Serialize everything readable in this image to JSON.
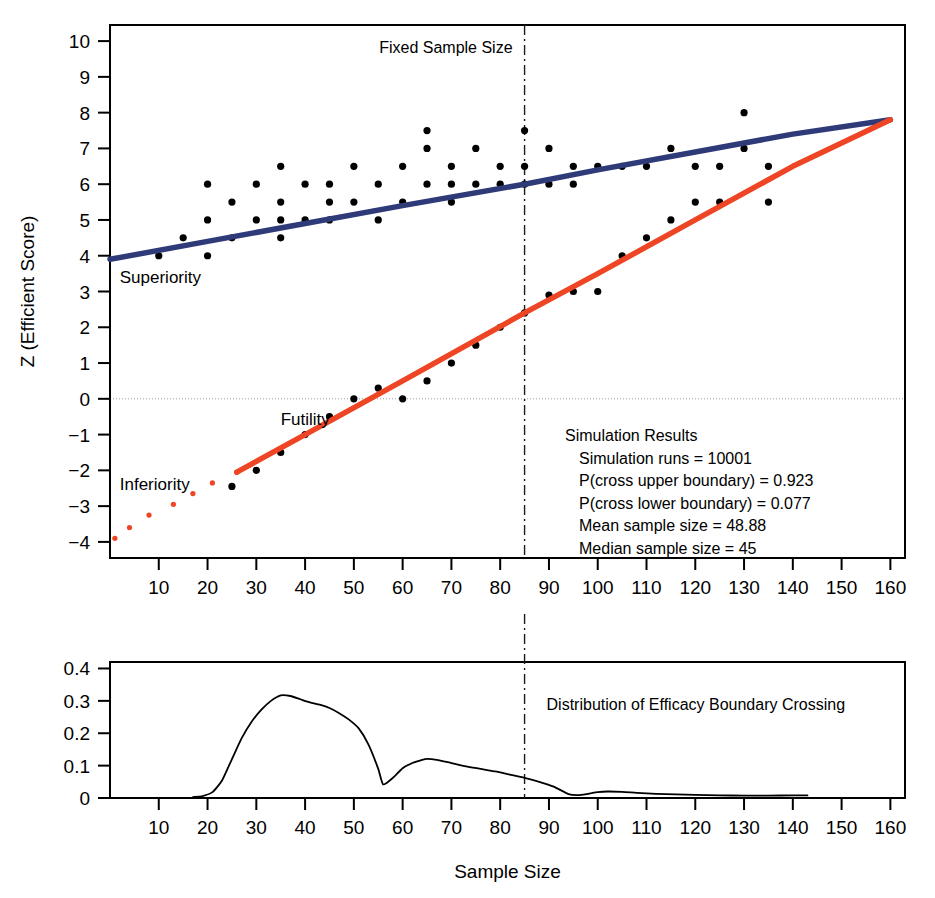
{
  "figure": {
    "name": "group-sequential-boundary-plot",
    "background": "#ffffff"
  },
  "colors": {
    "superiority_line": "#2f3a78",
    "futility_line": "#ee4524",
    "inferiority_points": "#ee4524",
    "scatter_points": "#000000",
    "axis": "#000000",
    "zero_line": "#999999",
    "fixed_sample_line": "#1a1a1a"
  },
  "main_panel": {
    "y_axis_label": "Z (Efficient Score)",
    "x_ticks": [
      10,
      20,
      30,
      40,
      50,
      60,
      70,
      80,
      90,
      100,
      110,
      120,
      130,
      140,
      150,
      160
    ],
    "y_ticks": [
      -4,
      -3,
      -2,
      -1,
      0,
      1,
      2,
      3,
      4,
      5,
      6,
      7,
      8,
      9,
      10
    ],
    "xlim": [
      0,
      163
    ],
    "ylim": [
      -4.45,
      10.45
    ],
    "annotations": {
      "fixed_sample_size": "Fixed Sample Size",
      "superiority": "Superiority",
      "futility": "Futility",
      "inferiority": "Inferiority"
    },
    "fixed_sample_size_x": 85,
    "zero_reference": 0
  },
  "simulation_results": {
    "title": "Simulation Results",
    "lines": [
      "Simulation runs = 10001",
      "P(cross upper boundary) =  0.923",
      "P(cross lower boundary) =  0.077",
      "Mean sample size =  48.88",
      "Median sample size =  45"
    ],
    "runs": 10001,
    "p_cross_upper": 0.923,
    "p_cross_lower": 0.077,
    "mean_sample_size": 48.88,
    "median_sample_size": 45
  },
  "bottom_panel": {
    "x_axis_label": "Sample Size",
    "title": "Distribution of Efficacy Boundary Crossing",
    "x_ticks": [
      10,
      20,
      30,
      40,
      50,
      60,
      70,
      80,
      90,
      100,
      110,
      120,
      130,
      140,
      150,
      160
    ],
    "y_ticks": [
      0,
      0.1,
      0.2,
      0.3,
      0.4
    ],
    "y_tick_labels": [
      "0",
      "0.1",
      "0.2",
      "0.3",
      "0.4"
    ],
    "xlim": [
      0,
      163
    ],
    "ylim": [
      0,
      0.42
    ],
    "fixed_sample_size_x": 85
  },
  "chart_data": {
    "type": "line",
    "xlabel": "Sample Size",
    "ylabel": "Z (Efficient Score)",
    "xlim": [
      0,
      163
    ],
    "ylim": [
      -4.45,
      10.45
    ],
    "grid": false,
    "legend": "inline-annotations",
    "series": [
      {
        "name": "Superiority boundary",
        "type": "line",
        "color": "#2f3a78",
        "points": [
          [
            0,
            3.9
          ],
          [
            20,
            4.4
          ],
          [
            40,
            4.9
          ],
          [
            60,
            5.4
          ],
          [
            85,
            6.0
          ],
          [
            100,
            6.4
          ],
          [
            120,
            6.9
          ],
          [
            140,
            7.4
          ],
          [
            160,
            7.8
          ]
        ]
      },
      {
        "name": "Futility boundary",
        "type": "line",
        "color": "#ee4524",
        "points": [
          [
            26,
            -2.05
          ],
          [
            40,
            -1.0
          ],
          [
            60,
            0.5
          ],
          [
            85,
            2.4
          ],
          [
            100,
            3.5
          ],
          [
            120,
            5.0
          ],
          [
            140,
            6.5
          ],
          [
            160,
            7.8
          ]
        ]
      },
      {
        "name": "Simulated efficient scores (upper cluster)",
        "type": "scatter",
        "color": "#000000",
        "points": [
          [
            10,
            4.0
          ],
          [
            15,
            4.5
          ],
          [
            20,
            4.0
          ],
          [
            20,
            5.0
          ],
          [
            20,
            6.0
          ],
          [
            25,
            4.5
          ],
          [
            25,
            5.5
          ],
          [
            30,
            5.0
          ],
          [
            30,
            6.0
          ],
          [
            35,
            4.5
          ],
          [
            35,
            5.0
          ],
          [
            35,
            5.5
          ],
          [
            35,
            6.5
          ],
          [
            40,
            5.0
          ],
          [
            40,
            6.0
          ],
          [
            45,
            5.0
          ],
          [
            45,
            5.5
          ],
          [
            45,
            6.0
          ],
          [
            50,
            5.5
          ],
          [
            50,
            6.5
          ],
          [
            55,
            5.0
          ],
          [
            55,
            6.0
          ],
          [
            60,
            5.5
          ],
          [
            60,
            6.5
          ],
          [
            65,
            6.0
          ],
          [
            65,
            7.0
          ],
          [
            65,
            7.5
          ],
          [
            70,
            5.5
          ],
          [
            70,
            6.0
          ],
          [
            70,
            6.5
          ],
          [
            75,
            6.0
          ],
          [
            75,
            7.0
          ],
          [
            80,
            6.0
          ],
          [
            80,
            6.5
          ],
          [
            85,
            6.0
          ],
          [
            85,
            6.5
          ],
          [
            85,
            7.5
          ],
          [
            90,
            6.0
          ],
          [
            90,
            7.0
          ],
          [
            95,
            6.0
          ],
          [
            95,
            6.5
          ],
          [
            100,
            6.5
          ],
          [
            105,
            6.5
          ],
          [
            110,
            6.5
          ],
          [
            115,
            7.0
          ],
          [
            120,
            6.5
          ],
          [
            125,
            6.5
          ],
          [
            130,
            7.0
          ],
          [
            130,
            8.0
          ],
          [
            135,
            6.5
          ]
        ]
      },
      {
        "name": "Simulated efficient scores (lower cluster)",
        "type": "scatter",
        "color": "#000000",
        "points": [
          [
            25,
            -2.45
          ],
          [
            30,
            -2.0
          ],
          [
            35,
            -1.5
          ],
          [
            40,
            -1.0
          ],
          [
            45,
            -0.5
          ],
          [
            50,
            0.0
          ],
          [
            55,
            0.3
          ],
          [
            60,
            0.0
          ],
          [
            65,
            0.5
          ],
          [
            70,
            1.0
          ],
          [
            75,
            1.5
          ],
          [
            80,
            2.0
          ],
          [
            85,
            2.4
          ],
          [
            90,
            2.9
          ],
          [
            95,
            3.0
          ],
          [
            100,
            3.0
          ],
          [
            105,
            4.0
          ],
          [
            110,
            4.5
          ],
          [
            115,
            5.0
          ],
          [
            120,
            5.5
          ],
          [
            125,
            5.5
          ],
          [
            135,
            5.5
          ]
        ]
      },
      {
        "name": "Inferiority boundary crossings",
        "type": "scatter",
        "color": "#ee4524",
        "points": [
          [
            1,
            -3.9
          ],
          [
            4,
            -3.6
          ],
          [
            8,
            -3.25
          ],
          [
            13,
            -2.95
          ],
          [
            17,
            -2.65
          ],
          [
            21,
            -2.35
          ],
          [
            26,
            -2.05
          ]
        ]
      }
    ],
    "density": {
      "name": "Distribution of Efficacy Boundary Crossing",
      "type": "line",
      "xlabel": "Sample Size",
      "ylabel": "",
      "xlim": [
        0,
        163
      ],
      "ylim": [
        0,
        0.42
      ],
      "x": [
        17,
        19,
        21,
        23,
        25,
        27,
        29,
        31,
        33,
        35,
        37,
        39,
        41,
        43,
        45,
        47,
        49,
        51,
        53,
        55,
        56,
        58,
        60,
        62,
        64,
        65,
        67,
        70,
        73,
        76,
        79,
        82,
        85,
        88,
        91,
        94,
        96,
        98,
        100,
        102,
        105,
        108,
        112,
        116,
        120,
        125,
        130,
        135,
        140,
        143
      ],
      "y": [
        0.003,
        0.006,
        0.018,
        0.055,
        0.12,
        0.185,
        0.235,
        0.272,
        0.3,
        0.317,
        0.315,
        0.305,
        0.295,
        0.288,
        0.278,
        0.262,
        0.242,
        0.215,
        0.165,
        0.09,
        0.042,
        0.062,
        0.092,
        0.108,
        0.118,
        0.121,
        0.118,
        0.108,
        0.098,
        0.09,
        0.082,
        0.072,
        0.062,
        0.05,
        0.035,
        0.012,
        0.009,
        0.013,
        0.018,
        0.02,
        0.019,
        0.016,
        0.013,
        0.011,
        0.0095,
        0.008,
        0.0075,
        0.0075,
        0.008,
        0.008
      ]
    }
  }
}
